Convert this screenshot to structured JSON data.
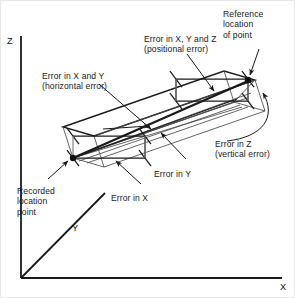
{
  "figure": {
    "type": "technical-diagram"
  },
  "axes": {
    "z_label": "Z",
    "x_label": "X",
    "y_label": "Y"
  },
  "annotations": {
    "reference_point": {
      "line1": "Reference",
      "line2": "location",
      "line3": "of point"
    },
    "positional_error": {
      "line1": "Error in X, Y and Z",
      "line2": "(positional error)"
    },
    "horizontal_error": {
      "line1": "Error in X and Y",
      "line2": "(horizontal error)"
    },
    "vertical_error": {
      "line1": "Error in Z",
      "line2": "(vertical error)"
    },
    "error_in_y": {
      "line1": "Error in Y"
    },
    "error_in_x": {
      "line1": "Error in X"
    },
    "recorded_point": {
      "line1": "Recorded",
      "line2": "location",
      "line3": "point"
    }
  },
  "colors": {
    "stroke": "#1a1a1a",
    "thin_stroke": "#4a4a4a",
    "background": "#ffffff",
    "text": "#1a1a1a"
  }
}
